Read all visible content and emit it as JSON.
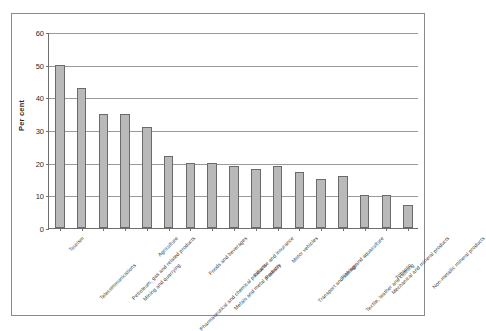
{
  "chart_data": {
    "type": "bar",
    "title": "",
    "xlabel": "",
    "ylabel": "Per cent",
    "ylim": [
      0,
      60
    ],
    "ytick_values": [
      0,
      10,
      20,
      30,
      40,
      50,
      60
    ],
    "ytick_labels": [
      "0",
      "10",
      "20",
      "30",
      "40",
      "50",
      "60"
    ],
    "grid": true,
    "legend": "none",
    "bar_color": "#b9b9b9",
    "bar_edge_color": "#6a6a6a",
    "categories": [
      "Tourism",
      "Telecommunications",
      "Petroleum, gas and related products",
      "Mining and quarrying",
      "Agriculture",
      "Pharmaceutical and chemical products",
      "Foods and beverages",
      "Metals and metal products",
      "Finance and insurance",
      "Forestry",
      "Motor vehicles",
      "Transport and storage",
      "Fishing and aquaculture",
      "Textile, leather and clothing",
      "Mechanical and mineral products",
      "Tobacco",
      "Non-metallic mineral products"
    ],
    "values": [
      50,
      43,
      35,
      35,
      31,
      22,
      20,
      20,
      19,
      18,
      19,
      17,
      15,
      16,
      10,
      10,
      7
    ]
  }
}
